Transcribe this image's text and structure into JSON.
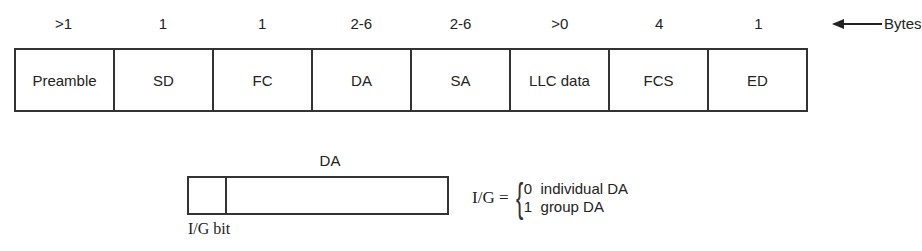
{
  "frame": {
    "fields": [
      {
        "name": "Preamble",
        "bytes": ">1"
      },
      {
        "name": "SD",
        "bytes": "1"
      },
      {
        "name": "FC",
        "bytes": "1"
      },
      {
        "name": "DA",
        "bytes": "2-6"
      },
      {
        "name": "SA",
        "bytes": "2-6"
      },
      {
        "name": "LLC data",
        "bytes": ">0"
      },
      {
        "name": "FCS",
        "bytes": "4"
      },
      {
        "name": "ED",
        "bytes": "1"
      }
    ],
    "units_label": "Bytes"
  },
  "da_detail": {
    "title": "DA",
    "bit_label": "I/G bit",
    "legend_lhs": "I/G =",
    "options": [
      "0  individual DA",
      "1  group DA"
    ]
  }
}
